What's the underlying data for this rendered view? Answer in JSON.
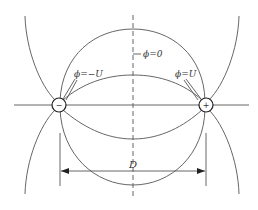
{
  "diagram": {
    "charges": [
      {
        "id": "negative",
        "sign": "−",
        "polarity": "negative"
      },
      {
        "id": "positive",
        "sign": "+",
        "polarity": "positive"
      }
    ],
    "labels": {
      "potential_negative": "ϕ=−U",
      "potential_positive": "ϕ=U",
      "potential_zero": "ϕ=0",
      "distance": "D"
    },
    "elements": {
      "axis_line": "horizontal axis through charges",
      "symmetry_line": "vertical dashed line (zero potential plane)",
      "field_lines": [
        "outer-top arc",
        "inner-top arc",
        "inner-bottom arc",
        "outer-bottom arc",
        "left outer curve",
        "right outer curve"
      ],
      "dimension": "distance D between charges"
    }
  }
}
